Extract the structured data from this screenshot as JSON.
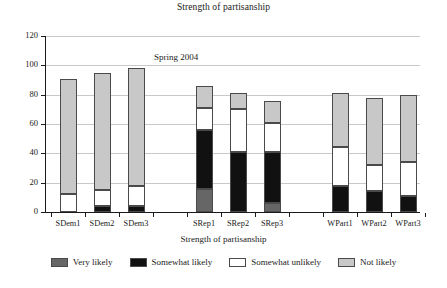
{
  "chart_data": {
    "type": "bar",
    "subtype": "stacked-bar",
    "title": "Strength of partisanship",
    "xlabel": "Strength of partisanship",
    "ylabel": "",
    "ylim": [
      0,
      120
    ],
    "yticks": [
      0,
      20,
      40,
      60,
      80,
      100,
      120
    ],
    "grid": true,
    "legend_position": "bottom",
    "annotations": [
      {
        "text": "Spring 2004",
        "x": "SDem3",
        "y": 105
      }
    ],
    "categories": [
      "SDem1",
      "SDem2",
      "SDem3",
      "SRep1",
      "SRep2",
      "SRep3",
      "WPart1",
      "WPart2",
      "WPart3"
    ],
    "series": [
      {
        "name": "Very likely",
        "color": "#666666",
        "values": [
          0,
          0,
          0,
          16,
          0,
          6,
          0,
          0,
          0
        ]
      },
      {
        "name": "Somewhat likely",
        "color": "#111111",
        "values": [
          0,
          4,
          4,
          40,
          41,
          35,
          18,
          14,
          11
        ]
      },
      {
        "name": "Somewhat unlikely",
        "color": "#ffffff",
        "values": [
          12,
          11,
          14,
          15,
          29,
          20,
          26,
          18,
          23
        ]
      },
      {
        "name": "Not likely",
        "color": "#c8c8c8",
        "values": [
          79,
          80,
          80,
          15,
          11,
          15,
          37,
          46,
          46
        ]
      }
    ],
    "totals": [
      91,
      95,
      98,
      86,
      81,
      76,
      81,
      78,
      80
    ]
  },
  "legend": {
    "items": [
      {
        "label": "Very likely",
        "color": "#666666"
      },
      {
        "label": "Somewhat likely",
        "color": "#111111"
      },
      {
        "label": "Somewhat unlikely",
        "color": "#ffffff"
      },
      {
        "label": "Not likely",
        "color": "#c8c8c8"
      }
    ]
  }
}
